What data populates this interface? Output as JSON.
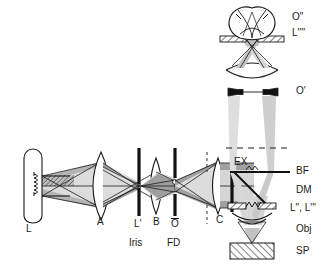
{
  "figure": {
    "type": "optical-ray-diagram",
    "background_color": "#ffffff",
    "line_color": "#1a1a1a",
    "beam_fill_light": "#d9d9d9",
    "beam_fill_dark": "#a8a8a8",
    "hatch_color": "#4d4d4d"
  },
  "labels": {
    "lamp": "L",
    "collector_lens": "A",
    "iris_plane": "L'",
    "iris": "Iris",
    "field_lens": "B",
    "field_diaphragm_plane": "O",
    "field_diaphragm": "FD",
    "condenser_lens": "C",
    "excitation_filter": "EX",
    "back_focal_plane": "BF",
    "dichroic_mirror": "DM",
    "objective_pupil": "L\", L'''",
    "objective": "Obj",
    "specimen": "SP",
    "intermediate_image": "O'",
    "final_image": "O\"",
    "exit_pupil": "L''''"
  },
  "label_meanings": {
    "L": "lamp / light source",
    "A": "collector lens",
    "L'": "image of lamp filament at iris plane",
    "Iris": "aperture iris diaphragm",
    "B": "field lens",
    "O": "object conjugate plane at field diaphragm",
    "FD": "field diaphragm",
    "C": "condenser / collimating lens",
    "EX": "excitation filter",
    "BF": "back focal plane",
    "DM": "dichroic mirror",
    "L\", L'''": "lamp conjugate at objective back aperture",
    "Obj": "objective lens",
    "SP": "specimen",
    "O'": "intermediate image plane",
    "O\"": "final image on retina",
    "L''''": "exit pupil at eye"
  },
  "optical_elements": [
    {
      "id": "lamp",
      "name": "L",
      "kind": "light-source",
      "x": 33,
      "y": 186
    },
    {
      "id": "lens-a",
      "name": "A",
      "kind": "lens",
      "x": 101,
      "y": 186
    },
    {
      "id": "iris",
      "name": "L' / Iris",
      "kind": "diaphragm",
      "x": 139,
      "y": 186
    },
    {
      "id": "lens-b",
      "name": "B",
      "kind": "lens",
      "x": 156,
      "y": 186
    },
    {
      "id": "fd",
      "name": "O / FD",
      "kind": "diaphragm",
      "x": 175,
      "y": 186
    },
    {
      "id": "lens-c",
      "name": "C",
      "kind": "lens",
      "x": 218,
      "y": 186
    },
    {
      "id": "ex-filter",
      "name": "EX",
      "kind": "filter",
      "x": 232,
      "y": 186
    },
    {
      "id": "dichroic",
      "name": "DM",
      "kind": "beam-splitter",
      "x": 252,
      "y": 190
    },
    {
      "id": "bf",
      "name": "BF",
      "kind": "plane",
      "x": 252,
      "y": 172
    },
    {
      "id": "obj-pupil",
      "name": "L\", L'''",
      "kind": "aperture",
      "x": 252,
      "y": 208
    },
    {
      "id": "objective",
      "name": "Obj",
      "kind": "lens",
      "x": 252,
      "y": 228
    },
    {
      "id": "specimen",
      "name": "SP",
      "kind": "sample",
      "x": 252,
      "y": 250
    },
    {
      "id": "image-o1",
      "name": "O'",
      "kind": "image-plane",
      "x": 252,
      "y": 92
    },
    {
      "id": "eyepiece",
      "name": "eyepiece",
      "kind": "lens",
      "x": 252,
      "y": 76
    },
    {
      "id": "eye",
      "name": "O\" / L''''",
      "kind": "eye",
      "x": 252,
      "y": 30
    }
  ],
  "annotations": [
    {
      "text": "O\"",
      "x": 292,
      "y": 18,
      "size": 10
    },
    {
      "text": "L''''",
      "x": 292,
      "y": 34,
      "size": 10
    },
    {
      "text": "O'",
      "x": 296,
      "y": 91,
      "size": 10
    },
    {
      "text": "BF",
      "x": 296,
      "y": 167,
      "size": 10
    },
    {
      "text": "DM",
      "x": 296,
      "y": 186,
      "size": 10
    },
    {
      "text": "L\", L'''",
      "x": 292,
      "y": 205,
      "size": 10
    },
    {
      "text": "Obj",
      "x": 296,
      "y": 227,
      "size": 10
    },
    {
      "text": "SP",
      "x": 296,
      "y": 248,
      "size": 10
    },
    {
      "text": "EX",
      "x": 229,
      "y": 163,
      "size": 10
    },
    {
      "text": "C",
      "x": 219,
      "y": 220,
      "size": 10
    },
    {
      "text": "L",
      "x": 29,
      "y": 229,
      "size": 10
    },
    {
      "text": "A",
      "x": 98,
      "y": 219,
      "size": 10
    },
    {
      "text": "L'",
      "x": 136,
      "y": 221,
      "size": 10
    },
    {
      "text": "Iris",
      "x": 132,
      "y": 240,
      "size": 10
    },
    {
      "text": "B",
      "x": 155,
      "y": 219,
      "size": 10
    },
    {
      "text": "O",
      "x": 173,
      "y": 221,
      "size": 10
    },
    {
      "text": "FD",
      "x": 170,
      "y": 240,
      "size": 10
    }
  ]
}
